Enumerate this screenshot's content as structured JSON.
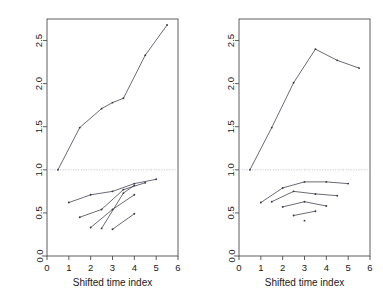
{
  "figure": {
    "background": "#ffffff",
    "line_color": "#3a3a4a",
    "refline_color": "#b9b9c4",
    "axis_color": "#4d4d4d"
  },
  "chart_data": [
    {
      "type": "line",
      "panel": "left",
      "title": "",
      "xlabel": "Shifted time index",
      "ylabel": "",
      "xlim": [
        0,
        6
      ],
      "ylim": [
        0.0,
        2.75
      ],
      "xticks": [
        0,
        1,
        2,
        3,
        4,
        5,
        6
      ],
      "xticklabels": [
        "0",
        "1",
        "2",
        "3",
        "4",
        "5",
        "6"
      ],
      "yticks": [
        0.0,
        0.5,
        1.0,
        1.5,
        2.0,
        2.5
      ],
      "yticklabels": [
        "0.0",
        "0.5",
        "1.0",
        "1.5",
        "2.0",
        "2.5"
      ],
      "grid": false,
      "legend": "none",
      "reference_line": {
        "y": 1.0,
        "style": "dotted",
        "color": "#b9b9c4"
      },
      "series": [
        {
          "name": "main-trajectory",
          "marker": "point",
          "x": [
            0.5,
            1.5,
            2.5,
            3.0,
            3.5,
            4.5,
            5.5
          ],
          "y": [
            1.0,
            1.49,
            1.71,
            1.78,
            1.83,
            2.33,
            2.68
          ]
        },
        {
          "name": "segment-1",
          "marker": "point",
          "x": [
            1.0,
            2.0,
            3.0,
            4.0,
            5.0
          ],
          "y": [
            0.62,
            0.71,
            0.75,
            0.84,
            0.89
          ]
        },
        {
          "name": "segment-2",
          "marker": "point",
          "x": [
            1.5,
            2.5,
            3.5,
            4.5
          ],
          "y": [
            0.45,
            0.54,
            0.77,
            0.85
          ]
        },
        {
          "name": "segment-3",
          "marker": "point",
          "x": [
            2.0,
            3.0,
            4.0
          ],
          "y": [
            0.33,
            0.54,
            0.71
          ]
        },
        {
          "name": "segment-4",
          "marker": "point",
          "x": [
            2.5,
            3.5,
            4.0
          ],
          "y": [
            0.32,
            0.73,
            0.82
          ]
        },
        {
          "name": "segment-5",
          "marker": "point",
          "x": [
            3.0,
            4.0
          ],
          "y": [
            0.31,
            0.49
          ]
        }
      ]
    },
    {
      "type": "line",
      "panel": "right",
      "title": "",
      "xlabel": "Shifted time index",
      "ylabel": "",
      "xlim": [
        0,
        6
      ],
      "ylim": [
        0.0,
        2.75
      ],
      "xticks": [
        0,
        1,
        2,
        3,
        4,
        5,
        6
      ],
      "xticklabels": [
        "0",
        "1",
        "2",
        "3",
        "4",
        "5",
        "6"
      ],
      "yticks": [
        0.0,
        0.5,
        1.0,
        1.5,
        2.0,
        2.5
      ],
      "yticklabels": [
        "0.0",
        "0.5",
        "1.0",
        "1.5",
        "2.0",
        "2.5"
      ],
      "grid": false,
      "legend": "none",
      "reference_line": {
        "y": 1.0,
        "style": "dotted",
        "color": "#b9b9c4"
      },
      "series": [
        {
          "name": "main-trajectory",
          "marker": "point",
          "x": [
            0.5,
            1.5,
            2.5,
            3.5,
            4.5,
            5.5
          ],
          "y": [
            1.0,
            1.49,
            2.01,
            2.4,
            2.27,
            2.18
          ]
        },
        {
          "name": "segment-1",
          "marker": "point",
          "x": [
            1.0,
            2.0,
            3.0,
            4.0,
            5.0
          ],
          "y": [
            0.62,
            0.79,
            0.86,
            0.86,
            0.84
          ]
        },
        {
          "name": "segment-2",
          "marker": "point",
          "x": [
            1.5,
            2.5,
            3.5,
            4.5
          ],
          "y": [
            0.63,
            0.75,
            0.72,
            0.7
          ]
        },
        {
          "name": "segment-3",
          "marker": "point",
          "x": [
            2.0,
            3.0,
            4.0
          ],
          "y": [
            0.57,
            0.63,
            0.58
          ]
        },
        {
          "name": "segment-4",
          "marker": "point",
          "x": [
            2.5,
            3.5
          ],
          "y": [
            0.47,
            0.52
          ]
        },
        {
          "name": "segment-5",
          "marker": "point",
          "x": [
            3.0
          ],
          "y": [
            0.41
          ]
        }
      ]
    }
  ]
}
